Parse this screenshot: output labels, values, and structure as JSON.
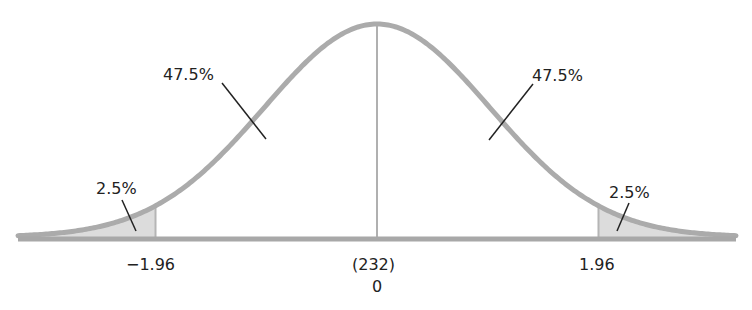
{
  "chart_data": {
    "type": "area",
    "title": "",
    "xlabel": "",
    "ylabel": "",
    "grid": false,
    "mean": 0,
    "mean_raw_value": "(232)",
    "critical_values": [
      -1.96,
      1.96
    ],
    "regions": [
      {
        "name": "left-tail",
        "range": [
          -3.2,
          -1.96
        ],
        "percent": "2.5%",
        "shaded": true
      },
      {
        "name": "left-center",
        "range": [
          -1.96,
          0
        ],
        "percent": "47.5%",
        "shaded": false
      },
      {
        "name": "right-center",
        "range": [
          0,
          1.96
        ],
        "percent": "47.5%",
        "shaded": false
      },
      {
        "name": "right-tail",
        "range": [
          1.96,
          3.2
        ],
        "percent": "2.5%",
        "shaded": true
      }
    ],
    "tick_labels": [
      "−1.96",
      "(232)",
      "0",
      "1.96"
    ]
  },
  "labels": {
    "left_tail_pct": "2.5%",
    "left_center_pct": "47.5%",
    "right_center_pct": "47.5%",
    "right_tail_pct": "2.5%",
    "tick_neg": "−1.96",
    "tick_pos": "1.96",
    "center_raw": "(232)",
    "center_z": "0"
  },
  "colors": {
    "curve": "#ababab",
    "shade": "#dcdcdc",
    "axis": "#a8a8a8",
    "leader": "#222222",
    "text": "#222222"
  }
}
